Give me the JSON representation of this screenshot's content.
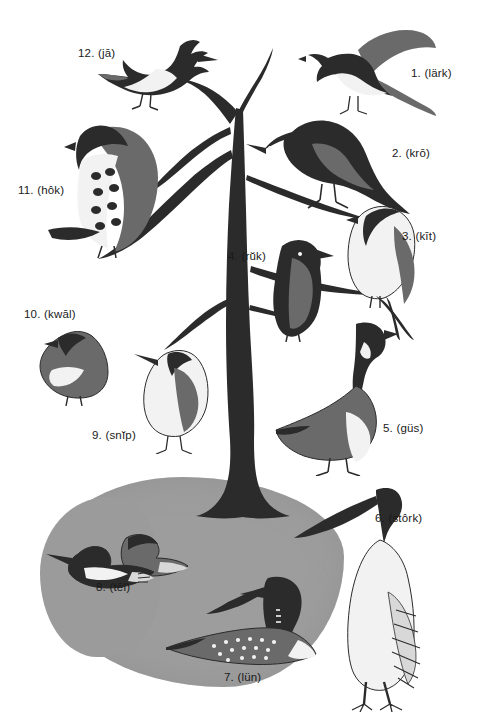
{
  "plate": {
    "title": "Bird identification plate",
    "background_color": "#ffffff",
    "pond_color": "#9d9d9d",
    "ink_color": "#2b2b2b"
  },
  "labels": [
    {
      "id": "lark",
      "number": "1.",
      "pron": "(lärk)",
      "text": "1.  (lärk)",
      "x": 411,
      "y": 68,
      "align": "left"
    },
    {
      "id": "crow",
      "number": "2.",
      "pron": "(krō)",
      "text": "2.  (krō)",
      "x": 392,
      "y": 148,
      "align": "left"
    },
    {
      "id": "kite",
      "number": "3.",
      "pron": "(kīt)",
      "text": "3.  (kīt)",
      "x": 402,
      "y": 231,
      "align": "left"
    },
    {
      "id": "rook",
      "number": "4.",
      "pron": "(rŭk)",
      "text": "4.  (rŭk)",
      "x": 228,
      "y": 251,
      "align": "left"
    },
    {
      "id": "goose",
      "number": "5.",
      "pron": "(güs)",
      "text": "5.  (güs)",
      "x": 383,
      "y": 423,
      "align": "left"
    },
    {
      "id": "stork",
      "number": "6.",
      "pron": "(stôrk)",
      "text": "6.  (stôrk)",
      "x": 375,
      "y": 513,
      "align": "left"
    },
    {
      "id": "loon",
      "number": "7.",
      "pron": "(lün)",
      "text": "7.  (lün)",
      "x": 224,
      "y": 672,
      "align": "left"
    },
    {
      "id": "teal",
      "number": "8.",
      "pron": "(tēl)",
      "text": "8.  (tēl)",
      "x": 96,
      "y": 582,
      "align": "left"
    },
    {
      "id": "snipe",
      "number": "9.",
      "pron": "(snĭp)",
      "text": "9.  (snĭp)",
      "x": 92,
      "y": 430,
      "align": "left"
    },
    {
      "id": "quail",
      "number": "10.",
      "pron": "(kwāl)",
      "text": "10.  (kwāl)",
      "x": 24,
      "y": 309,
      "align": "left"
    },
    {
      "id": "hawk",
      "number": "11.",
      "pron": "(hôk)",
      "text": "11.  (hôk)",
      "x": 18,
      "y": 185,
      "align": "left"
    },
    {
      "id": "jay",
      "number": "12.",
      "pron": "(jā)",
      "text": "12.  (jā)",
      "x": 78,
      "y": 48,
      "align": "left"
    }
  ],
  "birds": [
    {
      "id": "lark",
      "name": "meadowlark",
      "number": 1,
      "position": "upper-right",
      "posture": "flying-landing"
    },
    {
      "id": "crow",
      "name": "crow",
      "number": 2,
      "position": "upper-center-right",
      "posture": "perched"
    },
    {
      "id": "kite",
      "name": "swallow-tailed kite",
      "number": 3,
      "position": "right",
      "posture": "perched"
    },
    {
      "id": "rook",
      "name": "rook",
      "number": 4,
      "position": "center",
      "posture": "perched"
    },
    {
      "id": "goose",
      "name": "canada goose",
      "number": 5,
      "position": "lower-right",
      "posture": "standing"
    },
    {
      "id": "stork",
      "name": "stork",
      "number": 6,
      "position": "bottom-right",
      "posture": "standing"
    },
    {
      "id": "loon",
      "name": "loon",
      "number": 7,
      "position": "bottom-center",
      "posture": "swimming"
    },
    {
      "id": "teal",
      "name": "teal duck",
      "number": 8,
      "position": "bottom-left",
      "posture": "swimming"
    },
    {
      "id": "snipe",
      "name": "snipe",
      "number": 9,
      "position": "left-lower",
      "posture": "standing"
    },
    {
      "id": "quail",
      "name": "quail",
      "number": 10,
      "position": "left",
      "posture": "standing"
    },
    {
      "id": "hawk",
      "name": "hawk",
      "number": 11,
      "position": "upper-left",
      "posture": "perched"
    },
    {
      "id": "jay",
      "name": "blue jay",
      "number": 12,
      "position": "top-left",
      "posture": "perched"
    }
  ]
}
